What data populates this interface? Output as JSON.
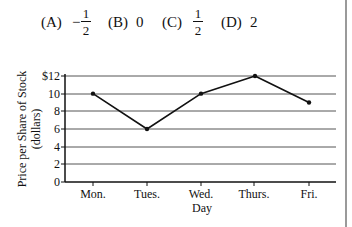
{
  "question": {
    "choices": [
      {
        "label": "(A)",
        "sign": "−",
        "num": "1",
        "den": "2"
      },
      {
        "label": "(B)",
        "value": "0"
      },
      {
        "label": "(C)",
        "num": "1",
        "den": "2"
      },
      {
        "label": "(D)",
        "value": "2"
      }
    ]
  },
  "chart_data": {
    "type": "line",
    "title": "",
    "xlabel": "Day",
    "ylabel": "Price per Share of Stock",
    "ylabel_unit": "(dollars)",
    "categories": [
      "Mon.",
      "Tues.",
      "Wed.",
      "Thurs.",
      "Fri."
    ],
    "values": [
      10,
      6,
      10,
      12,
      9
    ],
    "ylim": [
      0,
      12
    ],
    "yticks": [
      "0",
      "2",
      "4",
      "6",
      "8",
      "10",
      "$12"
    ],
    "grid": true,
    "legend": null,
    "colors": {
      "line": "#111111",
      "grid": "#555555",
      "axis": "#111111"
    }
  }
}
